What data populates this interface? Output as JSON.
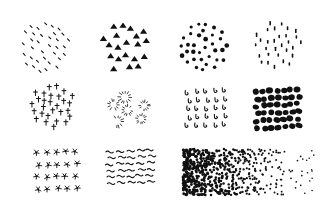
{
  "background": "#ffffff",
  "ink": "#111111",
  "swatches": [
    {
      "id": "sparse-dashes",
      "shape": "dash",
      "box": [
        18,
        22,
        52,
        50
      ],
      "row": 1,
      "col": 1,
      "layout": "blob",
      "count": 34,
      "size": 1.6
    },
    {
      "id": "triangles",
      "shape": "triangle",
      "box": [
        100,
        22,
        50,
        50
      ],
      "row": 1,
      "col": 2,
      "layout": "blob",
      "count": 20,
      "size": 3.6
    },
    {
      "id": "round-dots",
      "shape": "dot",
      "box": [
        179,
        22,
        50,
        50
      ],
      "row": 1,
      "col": 3,
      "layout": "blob",
      "count": 34,
      "size": 1.9
    },
    {
      "id": "vertical-ticks",
      "shape": "vtick",
      "box": [
        253,
        20,
        50,
        50
      ],
      "row": 1,
      "col": 4,
      "layout": "blob",
      "count": 30,
      "size": 2.0
    },
    {
      "id": "crosses",
      "shape": "cross",
      "box": [
        30,
        84,
        46,
        44
      ],
      "row": 2,
      "col": 1,
      "layout": "blob",
      "count": 28,
      "size": 3.0
    },
    {
      "id": "sunbursts",
      "shape": "burst",
      "box": [
        104,
        90,
        50,
        40
      ],
      "row": 2,
      "col": 2,
      "layout": "bursts",
      "count": 11,
      "size": 6.0
    },
    {
      "id": "loops",
      "shape": "loop",
      "box": [
        183,
        88,
        46,
        42
      ],
      "row": 2,
      "col": 3,
      "layout": "grid",
      "rows": 5,
      "cols": 5,
      "size": 2.6
    },
    {
      "id": "bold-blobs",
      "shape": "blob",
      "box": [
        253,
        88,
        48,
        44
      ],
      "row": 2,
      "col": 4,
      "layout": "grid",
      "rows": 6,
      "cols": 7,
      "size": 3.0
    },
    {
      "id": "scribble-stars",
      "shape": "star",
      "box": [
        32,
        147,
        48,
        48
      ],
      "row": 3,
      "col": 1,
      "layout": "grid",
      "rows": 4,
      "cols": 5,
      "size": 3.4
    },
    {
      "id": "squiggles",
      "shape": "squiggle",
      "box": [
        105,
        148,
        50,
        38
      ],
      "row": 3,
      "col": 2,
      "layout": "grid",
      "rows": 6,
      "cols": 5,
      "size": 4.0
    },
    {
      "id": "gradient-stipple",
      "shape": "dot",
      "box": [
        183,
        149,
        133,
        46
      ],
      "row": 3,
      "col": "3-4",
      "layout": "gradient",
      "count": 620,
      "size": 1.1
    }
  ]
}
